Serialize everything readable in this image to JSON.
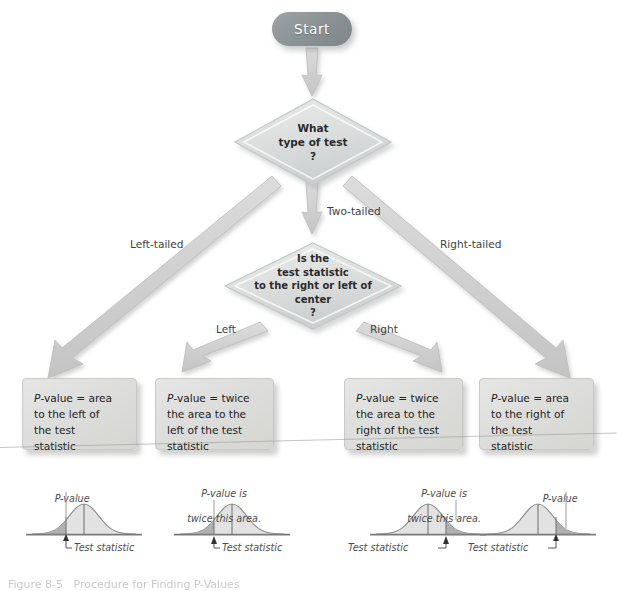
{
  "figure": {
    "caption": "Figure 8-5   Procedure for Finding P-Values",
    "type": "flowchart"
  },
  "start": {
    "label": "Start"
  },
  "decisions": [
    {
      "id": "type-of-test",
      "lines": [
        "What",
        "type of test",
        "?"
      ]
    },
    {
      "id": "statistic-side",
      "lines": [
        "Is the",
        "test statistic",
        "to the right or left of",
        "center",
        "?"
      ]
    }
  ],
  "edge_labels": {
    "left_tailed": "Left-tailed",
    "two_tailed": "Two-tailed",
    "right_tailed": "Right-tailed",
    "left": "Left",
    "right": "Right"
  },
  "outcome_boxes": [
    {
      "id": "left-tailed-outcome",
      "prefix": "P",
      "lines": [
        "-value = area",
        "to the left of",
        "the test",
        "statistic"
      ]
    },
    {
      "id": "two-tailed-left-outcome",
      "prefix": "P",
      "lines": [
        "-value = twice",
        "the area to the",
        "left of the test",
        "statistic"
      ]
    },
    {
      "id": "two-tailed-right-outcome",
      "prefix": "P",
      "lines": [
        "-value = twice",
        "the area to the",
        "right of the test",
        "statistic"
      ]
    },
    {
      "id": "right-tailed-outcome",
      "prefix": "P",
      "lines": [
        "-value = area",
        "to the right of",
        "the test",
        "statistic"
      ]
    }
  ],
  "curves": [
    {
      "id": "curve-left-tailed",
      "note": "P-value",
      "note_lines": [
        "P-value"
      ],
      "test_statistic_label": "Test statistic",
      "shaded_side": "left",
      "statistic_position": 0.38
    },
    {
      "id": "curve-two-tailed-left",
      "note": "P-value is twice this area.",
      "note_lines": [
        "P-value is",
        "twice this area."
      ],
      "test_statistic_label": "Test statistic",
      "shaded_side": "left",
      "statistic_position": 0.38
    },
    {
      "id": "curve-two-tailed-right",
      "note": "P-value is twice this area.",
      "note_lines": [
        "P-value is",
        "twice this area."
      ],
      "test_statistic_label": "Test statistic",
      "shaded_side": "right",
      "statistic_position": 0.62
    },
    {
      "id": "curve-right-tailed",
      "note": "P-value",
      "note_lines": [
        "P-value"
      ],
      "test_statistic_label": "Test statistic",
      "shaded_side": "right",
      "statistic_position": 0.62
    }
  ],
  "colors": {
    "start_fill": "#8d9496",
    "start_text": "#ffffff",
    "diamond_fill": "#d9dbdb",
    "diamond_edge": "#bfc3c3",
    "box_fill": "#dedede",
    "box_edge": "#c9c9c6",
    "arrow_fill": "#d2d2d2",
    "arrow_edge": "#b8b8b8",
    "curve_stroke": "#8f8f8f",
    "curve_shade": "#b4b4b4",
    "text": "#2b2b2b"
  }
}
